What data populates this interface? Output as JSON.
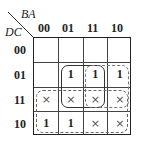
{
  "kmap": {
    "row_variable": "DC",
    "col_variable": "BA",
    "col_labels": [
      "00",
      "01",
      "11",
      "10"
    ],
    "row_labels": [
      "00",
      "01",
      "11",
      "10"
    ],
    "cells": [
      [
        "",
        "",
        "",
        ""
      ],
      [
        "",
        "1",
        "1",
        "1"
      ],
      [
        "×",
        "×",
        "×",
        "×"
      ],
      [
        "1",
        "1",
        "×",
        "×"
      ]
    ],
    "groups": [
      {
        "name": "group-solid-01-11-cols-01-11",
        "style": "solid",
        "rows": [
          1,
          2
        ],
        "cols": [
          1,
          2
        ]
      },
      {
        "name": "group-dashdot-01-11-cols-11-10",
        "style": "dashdot",
        "rows": [
          1,
          2
        ],
        "cols": [
          2,
          3
        ]
      },
      {
        "name": "group-dashed-11-10-all-cols",
        "style": "dashed",
        "rows": [
          2,
          3
        ],
        "cols": [
          0,
          3
        ]
      }
    ]
  }
}
